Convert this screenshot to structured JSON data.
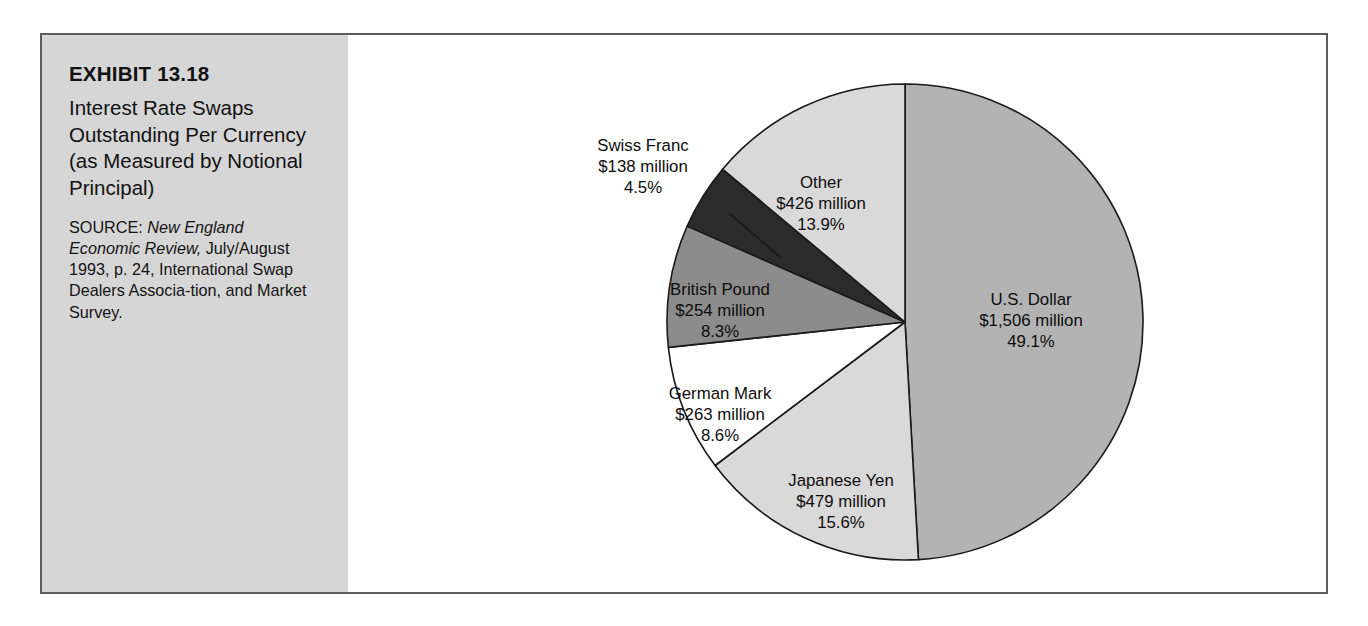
{
  "exhibit": {
    "number": "EXHIBIT 13.18",
    "title": "Interest Rate Swaps Outstanding Per Currency (as Measured by Notional Principal)",
    "source_label": "SOURCE:",
    "source_italic": "New England Economic Review,",
    "source_rest": "July/August 1993, p. 24, International Swap Dealers Associa-tion, and Market Survey."
  },
  "chart_data": {
    "type": "pie",
    "title": "Interest Rate Swaps Outstanding Per Currency (as Measured by Notional Principal)",
    "unit": "millions of U.S. dollars",
    "legend": "none",
    "start_angle_deg": 0,
    "direction": "clockwise",
    "categories": [
      "U.S. Dollar",
      "Japanese Yen",
      "German Mark",
      "British Pound",
      "Swiss Franc",
      "Other"
    ],
    "values": [
      1506,
      479,
      263,
      254,
      138,
      426
    ],
    "percents": [
      49.1,
      15.6,
      8.6,
      8.3,
      4.5,
      13.9
    ],
    "colors": [
      "#b3b3b3",
      "#d9d9d9",
      "#ffffff",
      "#8c8c8c",
      "#2b2b2b",
      "#d9d9d9"
    ],
    "slices": [
      {
        "name": "U.S. Dollar",
        "value_label": "$1,506 million",
        "percent_label": "49.1%",
        "value": 1506,
        "percent": 49.1,
        "color": "#b3b3b3",
        "label_placement": "inside"
      },
      {
        "name": "Japanese Yen",
        "value_label": "$479 million",
        "percent_label": "15.6%",
        "value": 479,
        "percent": 15.6,
        "color": "#d9d9d9",
        "label_placement": "inside"
      },
      {
        "name": "German Mark",
        "value_label": "$263 million",
        "percent_label": "8.6%",
        "value": 263,
        "percent": 8.6,
        "color": "#ffffff",
        "label_placement": "inside"
      },
      {
        "name": "British Pound",
        "value_label": "$254 million",
        "percent_label": "8.3%",
        "value": 254,
        "percent": 8.3,
        "color": "#8c8c8c",
        "label_placement": "inside"
      },
      {
        "name": "Swiss Franc",
        "value_label": "$138 million",
        "percent_label": "4.5%",
        "value": 138,
        "percent": 4.5,
        "color": "#2b2b2b",
        "label_placement": "outside-leader"
      },
      {
        "name": "Other",
        "value_label": "$426 million",
        "percent_label": "13.9%",
        "value": 426,
        "percent": 13.9,
        "color": "#d9d9d9",
        "label_placement": "inside"
      }
    ]
  },
  "style": {
    "panel_bg": "#d6d6d6",
    "frame_border": "#5c5c5c",
    "page_bg": "#ffffff",
    "text": "#111111"
  }
}
